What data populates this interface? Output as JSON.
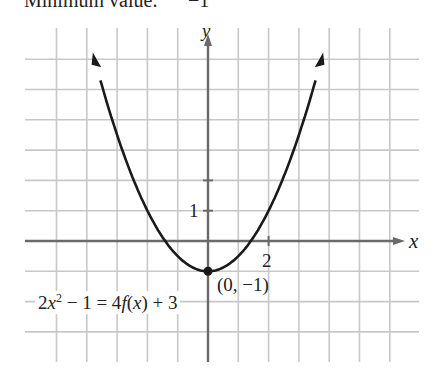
{
  "header": {
    "text": "Minimum value:      −1"
  },
  "chart_data": {
    "type": "line",
    "title": "",
    "function": "f(x) = 0.5x^2 - 1",
    "equation_label": "2x² − 1 = 4f(x) + 3",
    "xlabel": "x",
    "ylabel": "y",
    "xlim": [
      -6,
      7
    ],
    "ylim": [
      -4,
      7
    ],
    "grid": true,
    "tick_labels": [
      {
        "axis": "y",
        "value": 1,
        "text": "1"
      },
      {
        "axis": "x",
        "value": 2,
        "text": "2"
      }
    ],
    "series": [
      {
        "name": "parabola",
        "x": [
          -3.8,
          -3,
          -2,
          -1,
          0,
          1,
          2,
          3,
          3.8
        ],
        "values": [
          6.22,
          3.5,
          1,
          -0.5,
          -1,
          -0.5,
          1,
          3.5,
          6.22
        ]
      }
    ],
    "annotations": [
      {
        "type": "point",
        "x": 0,
        "y": -1,
        "text": "(0, −1)"
      }
    ]
  },
  "labels": {
    "y_axis": "y",
    "x_axis": "x",
    "tick_y1": "1",
    "tick_x2": "2",
    "vertex": "(0, −1)",
    "eq_pre": "2",
    "eq_x": "x",
    "eq_sup": "2",
    "eq_mid": " − 1 = 4",
    "eq_f": "f",
    "eq_paren_open": "(",
    "eq_x2": "x",
    "eq_post": ") + 3"
  }
}
